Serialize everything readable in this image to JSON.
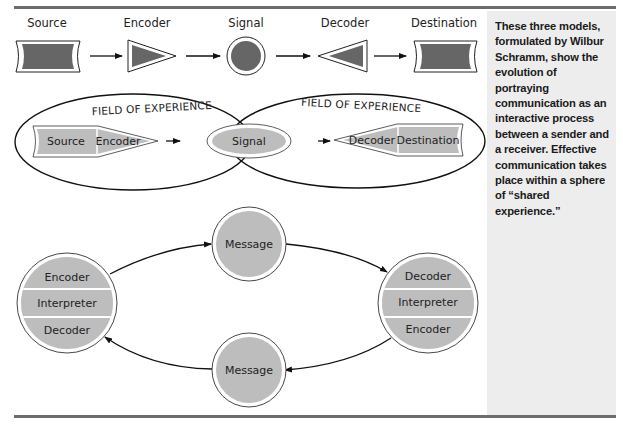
{
  "colors": {
    "dark_fill": "#666666",
    "light_fill": "#bdbdbd",
    "sidebar_bg": "#ededed",
    "rule": "#6c6c6c",
    "stroke": "#111111"
  },
  "linear_model": {
    "nodes": [
      {
        "label": "Source",
        "shape": "concave-rectangle"
      },
      {
        "label": "Encoder",
        "shape": "triangle-right"
      },
      {
        "label": "Signal",
        "shape": "circle"
      },
      {
        "label": "Decoder",
        "shape": "triangle-left"
      },
      {
        "label": "Destination",
        "shape": "concave-rectangle"
      }
    ]
  },
  "field_model": {
    "field_labels": [
      "FIELD OF EXPERIENCE",
      "FIELD OF EXPERIENCE"
    ],
    "sender": {
      "source": "Source",
      "encoder": "Encoder"
    },
    "signal": "Signal",
    "receiver": {
      "decoder": "Decoder",
      "destination": "Destination"
    }
  },
  "interactive_model": {
    "left_party": [
      "Encoder",
      "Interpreter",
      "Decoder"
    ],
    "right_party": [
      "Decoder",
      "Interpreter",
      "Encoder"
    ],
    "top_message": "Message",
    "bottom_message": "Message"
  },
  "sidebar": {
    "caption": "These three models, formulated by Wilbur Schramm, show the evolution of portraying communication as an interactive process between a sender and a receiver. Effective communication takes place within a sphere of “shared experience.”"
  }
}
